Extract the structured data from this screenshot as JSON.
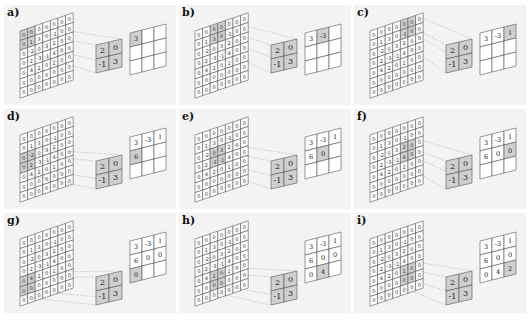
{
  "input": [
    [
      0,
      0,
      0,
      0,
      0,
      0,
      0
    ],
    [
      0,
      1,
      3,
      0,
      -1,
      0,
      0
    ],
    [
      0,
      -2,
      0,
      3,
      2,
      0,
      0
    ],
    [
      0,
      2,
      -3,
      -1,
      4,
      0,
      0
    ],
    [
      0,
      4,
      2,
      0,
      1,
      0,
      0
    ],
    [
      0,
      0,
      0,
      0,
      0,
      0,
      0
    ],
    [
      0,
      0,
      0,
      0,
      0,
      0,
      0
    ]
  ],
  "kernel": [
    [
      2,
      0
    ],
    [
      -1,
      3
    ]
  ],
  "output": [
    [
      3,
      -3,
      1
    ],
    [
      6,
      0,
      0
    ],
    [
      0,
      4,
      2
    ]
  ],
  "stride": 2,
  "panels": [
    {
      "label": "a)",
      "step": 1
    },
    {
      "label": "b)",
      "step": 2
    },
    {
      "label": "c)",
      "step": 3
    },
    {
      "label": "d)",
      "step": 4
    },
    {
      "label": "e)",
      "step": 5
    },
    {
      "label": "f)",
      "step": 6
    },
    {
      "label": "g)",
      "step": 7
    },
    {
      "label": "h)",
      "step": 8
    },
    {
      "label": "i)",
      "step": 9
    }
  ]
}
